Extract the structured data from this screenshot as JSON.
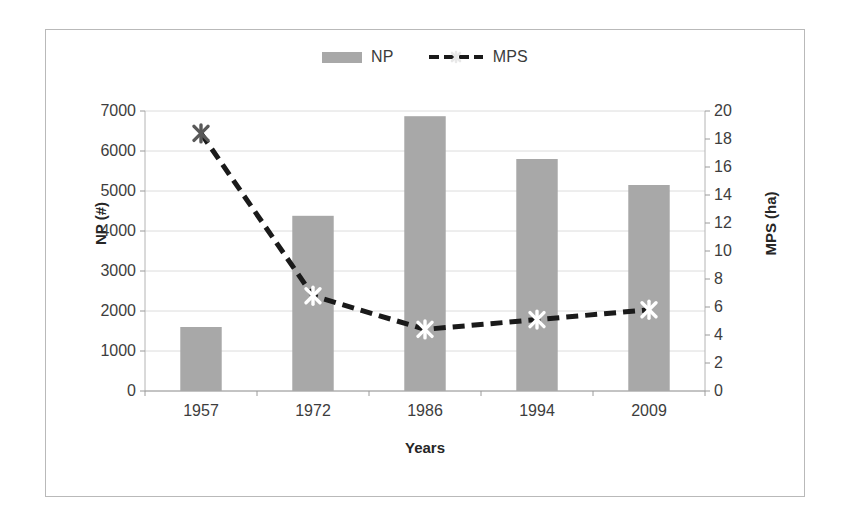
{
  "chart_data": {
    "type": "bar",
    "title": "",
    "subtitle": "",
    "categories": [
      "1957",
      "1972",
      "1986",
      "1994",
      "2009"
    ],
    "xlabel": "Years",
    "ylabel": "NP (#)",
    "y2label": "MPS (ha)",
    "ylim": [
      0,
      7000
    ],
    "y2lim": [
      0,
      20
    ],
    "yticks": [
      "7000",
      "6000",
      "5000",
      "4000",
      "3000",
      "2000",
      "1000",
      "0"
    ],
    "ytick_values": [
      7000,
      6000,
      5000,
      4000,
      3000,
      2000,
      1000,
      0
    ],
    "y2ticks": [
      "20",
      "18",
      "16",
      "14",
      "12",
      "10",
      "8",
      "6",
      "4",
      "2",
      "0"
    ],
    "y2tick_values": [
      20,
      18,
      16,
      14,
      12,
      10,
      8,
      6,
      4,
      2,
      0
    ],
    "grid": true,
    "grid_axis": "y",
    "legend_position": "top-center",
    "series": [
      {
        "name": "NP",
        "label": "NP",
        "kind": "bar",
        "axis": "left",
        "units": "#",
        "color": "#a8a8a8",
        "values": [
          1600,
          4380,
          6870,
          5800,
          5150
        ]
      },
      {
        "name": "MPS",
        "label": "MPS",
        "kind": "line",
        "axis": "right",
        "units": "ha",
        "color": "#1a1a1a",
        "linestyle": "dashed",
        "marker": "x-star",
        "marker_color": "#ffffff",
        "values": [
          18.4,
          6.8,
          4.4,
          5.1,
          5.8
        ]
      }
    ]
  },
  "legend": {
    "entries": [
      {
        "label": "NP",
        "swatch": "bar-swatch-icon"
      },
      {
        "label": "MPS",
        "swatch": "dashed-line-marker-icon"
      }
    ]
  }
}
